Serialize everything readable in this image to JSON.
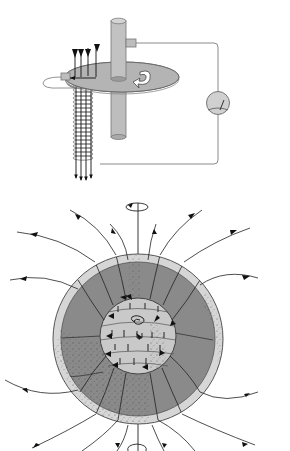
{
  "page": {
    "cutoff_caption": "",
    "background": "#ffffff"
  },
  "diagrams": [
    {
      "id": "disc-dynamo",
      "description": "Self-excited disc dynamo: rotating conducting disc on axle, coil beneath disc, wire circuit to galvanometer/meter",
      "components": [
        "axle",
        "rotating-disc",
        "rotation-arrow",
        "brush-contact-left",
        "brush-contact-axle",
        "coil",
        "field-arrows-down",
        "circuit-wire",
        "meter"
      ],
      "colors": {
        "disc": "#b4b4b4",
        "axle": "#bdbdbd",
        "meter": "#d0d0d0",
        "line": "#7a7a7a"
      }
    },
    {
      "id": "earth-geodynamo",
      "description": "Earth cross-section with mantle, outer core convection and magnetic field lines; rotation axis arrows at top and bottom",
      "components": [
        "rotation-axis",
        "rotation-arrow-top",
        "rotation-arrow-bottom",
        "crust",
        "mantle",
        "outer-core",
        "core-spiral",
        "field-lines"
      ],
      "colors": {
        "crust": "#d6d6d6",
        "mantle": "#8a8a8a",
        "core": "#c9c9c9",
        "line": "#2a2a2a"
      }
    }
  ]
}
